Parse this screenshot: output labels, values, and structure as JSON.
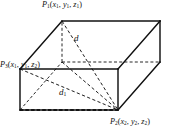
{
  "figure": {
    "kind": "3d-rectangular-box-distance-diagram",
    "width": 169,
    "height": 137,
    "background_color": "#ffffff",
    "stroke_color": "#111111",
    "solid_stroke_width": 1.4,
    "dashed_stroke_width": 0.9,
    "dash_pattern": "3,2.2"
  },
  "labels": {
    "p1": {
      "point": "P",
      "point_sub": "1",
      "open": "(",
      "x": "x",
      "x_sub": "1",
      "y": "y",
      "y_sub": "1",
      "z": "z",
      "z_sub": "1",
      "close": ")",
      "comma": ", ",
      "full_text": "P1(x1, y1, z1)"
    },
    "p3": {
      "point": "P",
      "point_sub": "3",
      "open": "(",
      "x": "x",
      "x_sub": "1",
      "y": "y",
      "y_sub": "1",
      "z": "z",
      "z_sub": "2",
      "close": ")",
      "comma": ", ",
      "full_text": "P3(x1, y1, z2)"
    },
    "p2": {
      "point": "P",
      "point_sub": "2",
      "open": "(",
      "x": "x",
      "x_sub": "2",
      "y": "y",
      "y_sub": "2",
      "z": "z",
      "z_sub": "2",
      "close": ")",
      "comma": ", ",
      "full_text": "P2(x2, y2, z2)"
    },
    "d": {
      "text": "d",
      "sub": "",
      "meaning": "space-diagonal-from-P1-to-P2"
    },
    "d1": {
      "text": "d",
      "sub": "1",
      "meaning": "base-diagonal"
    }
  },
  "geometry": {
    "vertices": {
      "front_top_left": [
        20,
        69
      ],
      "front_top_right": [
        118,
        69
      ],
      "front_bottom_left": [
        20,
        110
      ],
      "front_bottom_right": [
        118,
        110
      ],
      "back_top_left": [
        62,
        21
      ],
      "back_top_right": [
        160,
        21
      ],
      "back_bottom_left": [
        62,
        62
      ],
      "back_bottom_right": [
        160,
        62
      ]
    },
    "solid_edges": [
      "front_top_left-front_top_right",
      "front_top_right-front_bottom_right",
      "front_bottom_right-front_bottom_left",
      "front_bottom_left-front_top_left",
      "back_top_left-back_top_right",
      "back_top_right-back_bottom_right",
      "front_top_left-back_top_left",
      "front_top_right-back_top_right",
      "front_bottom_right-back_bottom_right"
    ],
    "dashed_edges": [
      "back_bottom_left-back_bottom_right",
      "back_bottom_left-back_top_left",
      "front_bottom_left-back_bottom_left"
    ],
    "dashed_diagonals": [
      "back_top_left-front_bottom_right",
      "back_top_left-back_bottom_left",
      "back_bottom_left-front_bottom_right",
      "front_bottom_left-front_bottom_right"
    ]
  }
}
